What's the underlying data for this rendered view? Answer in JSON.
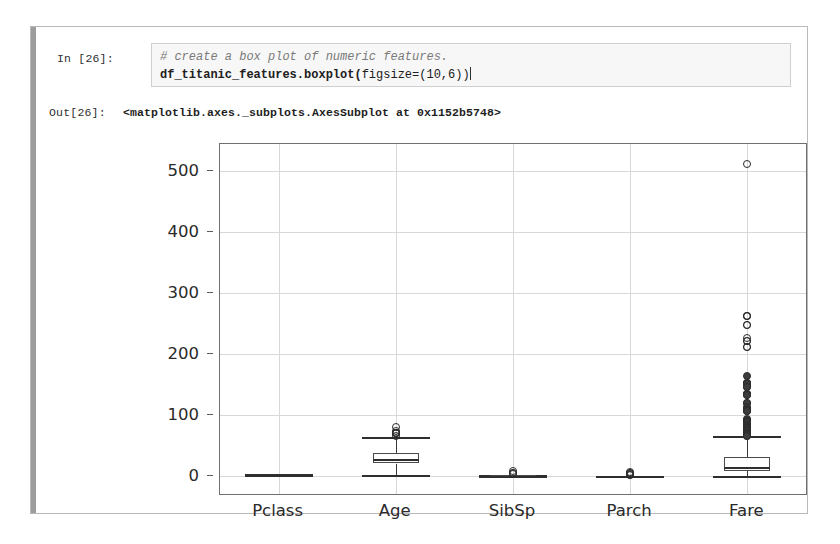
{
  "notebook": {
    "input_prompt": "In [26]:",
    "output_prompt": "Out[26]:",
    "code_comment": "# create a box plot of numeric features.",
    "code_line_bold": "df_titanic_features.boxplot(",
    "code_line_args": "figsize=(10,6))",
    "output_text": "<matplotlib.axes._subplots.AxesSubplot at 0x1152b5748>"
  },
  "colors": {
    "cell_border": "#b9b9b9",
    "cell_left_bar": "#9d9d9d",
    "code_bg": "#f7f7f7",
    "code_border": "#cfcfcf",
    "comment_text": "#7a7a7a",
    "grid": "#d8d8d8",
    "axis": "#6f6f6f",
    "marker": "#2c2c2c"
  },
  "chart_data": {
    "type": "box",
    "title": "",
    "xlabel": "",
    "ylabel": "",
    "ylim": [
      -30,
      545
    ],
    "yticks": [
      0,
      100,
      200,
      300,
      400,
      500
    ],
    "ytick_labels": [
      "0",
      "100",
      "200",
      "300",
      "400",
      "500"
    ],
    "categories": [
      "Pclass",
      "Age",
      "SibSp",
      "Parch",
      "Fare"
    ],
    "grid": true,
    "legend": "none",
    "boxes": [
      {
        "name": "Pclass",
        "whisker_low": 1,
        "q1": 2,
        "median": 3,
        "q3": 3,
        "whisker_high": 3,
        "fliers": []
      },
      {
        "name": "Age",
        "whisker_low": 0.42,
        "q1": 20.1,
        "median": 28,
        "q3": 38,
        "whisker_high": 64,
        "fliers": [
          66,
          70,
          70.5,
          71,
          71,
          74,
          80
        ]
      },
      {
        "name": "SibSp",
        "whisker_low": 0,
        "q1": 0,
        "median": 0,
        "q3": 1,
        "whisker_high": 2,
        "fliers": [
          3,
          4,
          5,
          8
        ]
      },
      {
        "name": "Parch",
        "whisker_low": 0,
        "q1": 0,
        "median": 0,
        "q3": 0,
        "whisker_high": 0,
        "fliers": [
          1,
          2,
          3,
          4,
          5,
          6
        ]
      },
      {
        "name": "Fare",
        "whisker_low": 0,
        "q1": 7.9,
        "median": 14.45,
        "q3": 31,
        "whisker_high": 65,
        "fliers": [
          512.3,
          263,
          263,
          262,
          247,
          247,
          227,
          221,
          221,
          211,
          211,
          164,
          153,
          153,
          153,
          151,
          146,
          146,
          135,
          135,
          134,
          134,
          133,
          133,
          120,
          120,
          113,
          110,
          108,
          107,
          106,
          106,
          93,
          91,
          91,
          90,
          90,
          89,
          86,
          83,
          83,
          82,
          81,
          80,
          79,
          79,
          78,
          78,
          77,
          77,
          77,
          76,
          76,
          75,
          73,
          73,
          71,
          71,
          70,
          70,
          69,
          69,
          69,
          67,
          66,
          66
        ]
      }
    ]
  }
}
